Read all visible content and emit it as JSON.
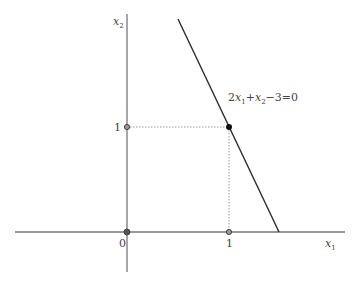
{
  "diagram": {
    "axes": {
      "x_label": "x",
      "x_label_sub": "1",
      "y_label": "x",
      "y_label_sub": "2"
    },
    "ticks": {
      "origin": "0",
      "x_one": "1",
      "y_one": "1"
    },
    "equation": {
      "c1": "2",
      "v1": "x",
      "s1": "1",
      "plus": "+",
      "v2": "x",
      "s2": "2",
      "rest": "−3=0"
    },
    "points": [
      {
        "name": "origin",
        "x": 0,
        "y": 0,
        "style": "hollow"
      },
      {
        "name": "x1-intercept-unit",
        "x": 1,
        "y": 0,
        "style": "hollow"
      },
      {
        "name": "x2-unit",
        "x": 0,
        "y": 1,
        "style": "hollow"
      },
      {
        "name": "solution-point",
        "x": 1,
        "y": 1,
        "style": "filled"
      }
    ],
    "line": {
      "equation": "2x1 + x2 - 3 = 0"
    },
    "colors": {
      "axis": "#777777",
      "line": "#2a2a2a",
      "guide": "#9a9a9a"
    }
  }
}
